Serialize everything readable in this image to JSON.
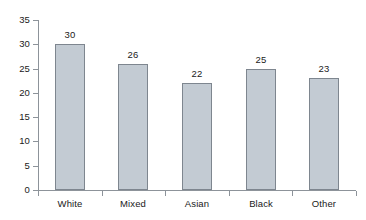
{
  "chart_data": {
    "type": "bar",
    "title": "",
    "xlabel": "",
    "ylabel": "",
    "categories": [
      "White",
      "Mixed",
      "Asian",
      "Black",
      "Other"
    ],
    "values": [
      30,
      26,
      22,
      25,
      23
    ],
    "value_labels": [
      "30",
      "26",
      "22",
      "25",
      "23"
    ],
    "ylim": [
      0,
      35
    ],
    "ytick_labels": [
      "0",
      "5",
      "10",
      "15",
      "20",
      "25",
      "30",
      "35"
    ],
    "ytick_values": [
      0,
      5,
      10,
      15,
      20,
      25,
      30,
      35
    ],
    "grid": false,
    "legend": null,
    "bar_fill_color": "#c3cbd3",
    "bar_border_color": "#7e868f",
    "axis_color": "#8d939a",
    "background_color": "#ffffff"
  }
}
